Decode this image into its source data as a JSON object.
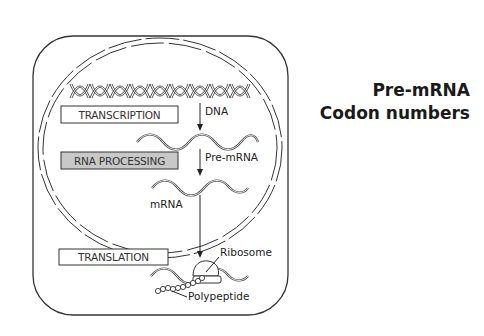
{
  "diagram": {
    "process_boxes": [
      {
        "label": "TRANSCRIPTION",
        "shaded": false
      },
      {
        "label": "RNA PROCESSING",
        "shaded": true
      },
      {
        "label": "TRANSLATION",
        "shaded": false
      }
    ],
    "molecule_labels": {
      "dna": "DNA",
      "pre_mrna": "Pre-mRNA",
      "mrna": "mRNA",
      "ribosome": "Ribosome",
      "polypeptide": "Polypeptide"
    },
    "colors": {
      "outline": "#333333",
      "shaded_box": "#c8c8c8",
      "background": "#ffffff"
    }
  },
  "side_text": {
    "line1": "Pre-mRNA",
    "line2": "Codon numbers"
  }
}
